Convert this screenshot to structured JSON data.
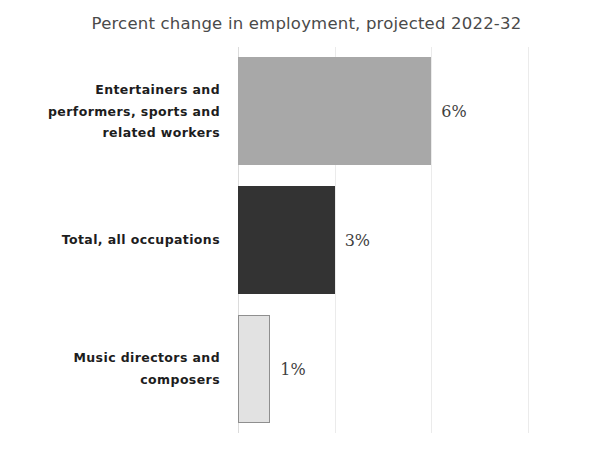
{
  "chart_data": {
    "type": "bar",
    "orientation": "horizontal",
    "title": "Percent change in employment, projected 2022-32",
    "xlabel": "",
    "ylabel": "",
    "categories": [
      "Entertainers and performers, sports and related workers",
      "Total, all occupations",
      "Music directors and composers"
    ],
    "values": [
      6,
      3,
      1
    ],
    "value_labels": [
      "6%",
      "3%",
      "1%"
    ],
    "xlim": [
      0,
      9
    ],
    "xticks": [
      0,
      3,
      6,
      9
    ],
    "grid": true,
    "legend": "none",
    "bar_colors": [
      "#a8a8a8",
      "#333333",
      "#e2e2e2"
    ],
    "bar_border_colors": [
      "#a8a8a8",
      "#333333",
      "#8f8f8f"
    ]
  },
  "title": {
    "text": "Percent change in employment, projected 2022-32"
  },
  "bars": [
    {
      "label_lines": [
        "Entertainers and",
        "performers, sports and",
        "related workers"
      ],
      "value": 6,
      "value_label": "6%",
      "color": "#a8a8a8",
      "border_color": "#a8a8a8"
    },
    {
      "label_lines": [
        "Total, all occupations"
      ],
      "value": 3,
      "value_label": "3%",
      "color": "#333333",
      "border_color": "#333333"
    },
    {
      "label_lines": [
        "Music directors and",
        "composers"
      ],
      "value": 1,
      "value_label": "1%",
      "color": "#e2e2e2",
      "border_color": "#8f8f8f"
    }
  ],
  "gridlines": {
    "values": [
      0,
      3,
      6,
      9
    ],
    "color": "#ebebeb"
  }
}
